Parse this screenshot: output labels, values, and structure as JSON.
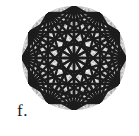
{
  "figure": {
    "label": "f.",
    "caption_position": "bottom-left",
    "shape": "circle",
    "colors": {
      "background": "#ffffff",
      "disc_fill": "#b4b4b4",
      "disc_light": "#dcdcdc",
      "grid_line": "#f2f2f2",
      "tile_diagonal": "#efefef",
      "chord_dark": "#1c1c1c",
      "label_text": "#1a1a1a"
    },
    "geometry": {
      "center_x": 74,
      "center_y": 58,
      "radius": 52,
      "grid_cells_across": 8,
      "grid_cell_size": 13,
      "chord_vertices": 12,
      "chord_line_width": 2.4,
      "thin_line_width": 1.0
    },
    "chord_steps": [
      2,
      3,
      4,
      5,
      6
    ]
  }
}
